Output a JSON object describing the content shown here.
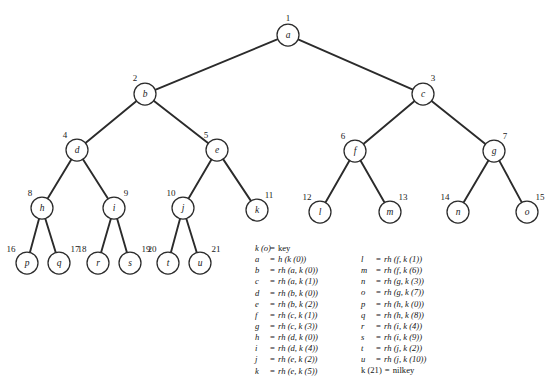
{
  "figure": {
    "background_color": "#ffffff",
    "line_color": "#2b2b2b",
    "node_fill": "#ffffff"
  },
  "tree": {
    "nodes": [
      {
        "id": "a",
        "number": "1",
        "label": "a",
        "x": 288,
        "y": 35,
        "r": 11
      },
      {
        "id": "b",
        "number": "2",
        "label": "b",
        "x": 145,
        "y": 94,
        "r": 11
      },
      {
        "id": "c",
        "number": "3",
        "label": "c",
        "x": 423,
        "y": 94,
        "r": 11
      },
      {
        "id": "d",
        "number": "4",
        "label": "d",
        "x": 77,
        "y": 150,
        "r": 11
      },
      {
        "id": "e",
        "number": "5",
        "label": "e",
        "x": 217,
        "y": 150,
        "r": 11
      },
      {
        "id": "f",
        "number": "6",
        "label": "f",
        "x": 355,
        "y": 151,
        "r": 11
      },
      {
        "id": "g",
        "number": "7",
        "label": "g",
        "x": 494,
        "y": 151,
        "r": 11
      },
      {
        "id": "h",
        "number": "8",
        "label": "h",
        "x": 42,
        "y": 208,
        "r": 11
      },
      {
        "id": "i",
        "number": "9",
        "label": "i",
        "x": 114,
        "y": 208,
        "r": 11
      },
      {
        "id": "j",
        "number": "10",
        "label": "j",
        "x": 183,
        "y": 208,
        "r": 11
      },
      {
        "id": "k",
        "number": "11",
        "label": "k",
        "x": 257,
        "y": 210,
        "r": 11
      },
      {
        "id": "l",
        "number": "12",
        "label": "l",
        "x": 320,
        "y": 212,
        "r": 11
      },
      {
        "id": "m",
        "number": "13",
        "label": "m",
        "x": 390,
        "y": 212,
        "r": 11
      },
      {
        "id": "n",
        "number": "14",
        "label": "n",
        "x": 458,
        "y": 212,
        "r": 11
      },
      {
        "id": "o",
        "number": "15",
        "label": "o",
        "x": 527,
        "y": 212,
        "r": 11
      },
      {
        "id": "p",
        "number": "16",
        "label": "p",
        "x": 27,
        "y": 263,
        "r": 11
      },
      {
        "id": "q",
        "number": "17",
        "label": "q",
        "x": 59,
        "y": 263,
        "r": 11
      },
      {
        "id": "r",
        "number": "18",
        "label": "r",
        "x": 98,
        "y": 263,
        "r": 11
      },
      {
        "id": "s",
        "number": "19",
        "label": "s",
        "x": 130,
        "y": 263,
        "r": 11
      },
      {
        "id": "t",
        "number": "20",
        "label": "t",
        "x": 168,
        "y": 263,
        "r": 11
      },
      {
        "id": "u",
        "number": "21",
        "label": "u",
        "x": 200,
        "y": 263,
        "r": 11
      }
    ],
    "edges": [
      [
        "a",
        "b"
      ],
      [
        "a",
        "c"
      ],
      [
        "b",
        "d"
      ],
      [
        "b",
        "e"
      ],
      [
        "c",
        "f"
      ],
      [
        "c",
        "g"
      ],
      [
        "d",
        "h"
      ],
      [
        "d",
        "i"
      ],
      [
        "e",
        "j"
      ],
      [
        "e",
        "k"
      ],
      [
        "f",
        "l"
      ],
      [
        "f",
        "m"
      ],
      [
        "g",
        "n"
      ],
      [
        "g",
        "o"
      ],
      [
        "h",
        "p"
      ],
      [
        "h",
        "q"
      ],
      [
        "i",
        "r"
      ],
      [
        "i",
        "s"
      ],
      [
        "j",
        "t"
      ],
      [
        "j",
        "u"
      ]
    ],
    "number_offsets": {
      "a": {
        "dx": 0,
        "dy": -14
      },
      "b": {
        "dx": -10,
        "dy": -13
      },
      "c": {
        "dx": 10,
        "dy": -13
      },
      "d": {
        "dx": -12,
        "dy": -12
      },
      "e": {
        "dx": -11,
        "dy": -12
      },
      "f": {
        "dx": -12,
        "dy": -12
      },
      "g": {
        "dx": 11,
        "dy": -12
      },
      "h": {
        "dx": -12,
        "dy": -12
      },
      "i": {
        "dx": 12,
        "dy": -12
      },
      "j": {
        "dx": -12,
        "dy": -12
      },
      "k": {
        "dx": 12,
        "dy": -12
      },
      "l": {
        "dx": -13,
        "dy": -12
      },
      "m": {
        "dx": 13,
        "dy": -12
      },
      "n": {
        "dx": -13,
        "dy": -12
      },
      "o": {
        "dx": 13,
        "dy": -12
      },
      "p": {
        "dx": -16,
        "dy": -11
      },
      "q": {
        "dx": 16,
        "dy": -11
      },
      "r": {
        "dx": -16,
        "dy": -11
      },
      "s": {
        "dx": 16,
        "dy": -11
      },
      "t": {
        "dx": -16,
        "dy": -11
      },
      "u": {
        "dx": 16,
        "dy": -11
      }
    }
  },
  "legend": {
    "header": {
      "lhs": "k (o)",
      "eq": "=",
      "rhs": "key",
      "rhs_plain": true
    },
    "left_column": [
      {
        "lhs": "a",
        "eq": "=",
        "rhs": "h (k (0))"
      },
      {
        "lhs": "b",
        "eq": "=",
        "rhs": "rh (a, k (0))"
      },
      {
        "lhs": "c",
        "eq": "=",
        "rhs": "rh (a, k (1))"
      },
      {
        "lhs": "d",
        "eq": "=",
        "rhs": "rh (b, k (0))"
      },
      {
        "lhs": "e",
        "eq": "=",
        "rhs": "rh (b, k (2))"
      },
      {
        "lhs": "f",
        "eq": "=",
        "rhs": "rh (c, k (1))"
      },
      {
        "lhs": "g",
        "eq": "=",
        "rhs": "rh (c, k (3))"
      },
      {
        "lhs": "h",
        "eq": "=",
        "rhs": "rh (d, k (0))"
      },
      {
        "lhs": "i",
        "eq": "=",
        "rhs": "rh (d, k (4))"
      },
      {
        "lhs": "j",
        "eq": "=",
        "rhs": "rh (e, k (2))"
      },
      {
        "lhs": "k",
        "eq": "=",
        "rhs": "rh (e, k (5))"
      }
    ],
    "right_column": [
      {
        "lhs": "l",
        "eq": "=",
        "rhs": "rh (f, k (1))"
      },
      {
        "lhs": "m",
        "eq": "=",
        "rhs": "rh (f, k (6))"
      },
      {
        "lhs": "n",
        "eq": "=",
        "rhs": "rh (g, k (3))"
      },
      {
        "lhs": "o",
        "eq": "=",
        "rhs": "rh (g, k (7))"
      },
      {
        "lhs": "p",
        "eq": "=",
        "rhs": "rh (h, k (0))"
      },
      {
        "lhs": "q",
        "eq": "=",
        "rhs": "rh (h, k (8))"
      },
      {
        "lhs": "r",
        "eq": "=",
        "rhs": "rh (i, k (4))"
      },
      {
        "lhs": "s",
        "eq": "=",
        "rhs": "rh (i, k (9))"
      },
      {
        "lhs": "t",
        "eq": "=",
        "rhs": "rh (j, k (2))"
      },
      {
        "lhs": "u",
        "eq": "=",
        "rhs": "rh (j, k (10))"
      },
      {
        "lhs": "k (21)",
        "eq": "=",
        "rhs": "nilkey",
        "special": true,
        "rhs_plain": true
      }
    ]
  }
}
